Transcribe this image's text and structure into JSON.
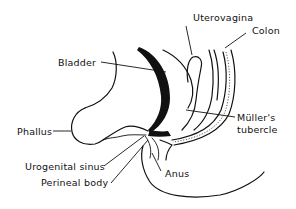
{
  "diagram": {
    "type": "anatomical-sagittal-section",
    "colors": {
      "ink": "#111111",
      "background": "#ffffff"
    },
    "labels": {
      "uterovagina": "Uterovagina",
      "colon": "Colon",
      "bladder": "Bladder",
      "muller_tubercle_line1": "Müller's",
      "muller_tubercle_line2": "tubercle",
      "phallus": "Phallus",
      "urogenital_sinus": "Urogenital sinus",
      "perineal_body": "Perineal body",
      "anus": "Anus"
    }
  }
}
